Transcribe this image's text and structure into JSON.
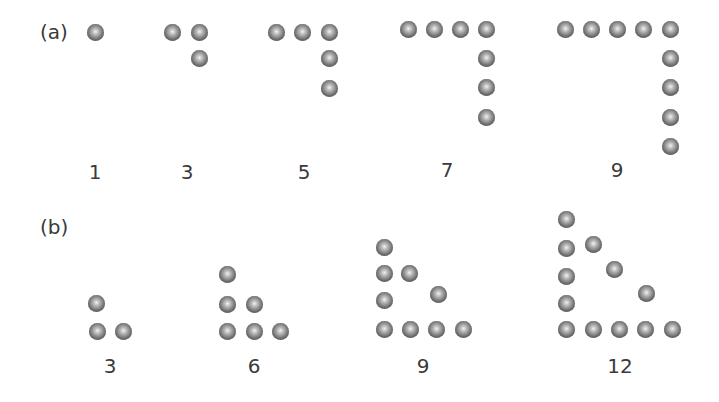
{
  "parts": [
    {
      "label": "(a)",
      "x": 40,
      "y": 32
    },
    {
      "label": "(b)",
      "x": 40,
      "y": 227
    }
  ],
  "figures": [
    {
      "part": "a",
      "count": "1",
      "label_pos": [
        95,
        172
      ],
      "dots": [
        [
          95,
          32
        ]
      ]
    },
    {
      "part": "a",
      "count": "3",
      "label_pos": [
        187,
        172
      ],
      "dots": [
        [
          172,
          32
        ],
        [
          199,
          32
        ],
        [
          199,
          58
        ]
      ]
    },
    {
      "part": "a",
      "count": "5",
      "label_pos": [
        304,
        172
      ],
      "dots": [
        [
          276,
          32
        ],
        [
          302,
          32
        ],
        [
          329,
          32
        ],
        [
          329,
          58
        ],
        [
          329,
          88
        ]
      ]
    },
    {
      "part": "a",
      "count": "7",
      "label_pos": [
        447,
        170
      ],
      "dots": [
        [
          408,
          29
        ],
        [
          434,
          29
        ],
        [
          460,
          29
        ],
        [
          486,
          29
        ],
        [
          486,
          58
        ],
        [
          486,
          87
        ],
        [
          486,
          117
        ]
      ]
    },
    {
      "part": "a",
      "count": "9",
      "label_pos": [
        617,
        170
      ],
      "dots": [
        [
          565,
          29
        ],
        [
          591,
          29
        ],
        [
          617,
          29
        ],
        [
          643,
          29
        ],
        [
          670,
          29
        ],
        [
          670,
          58
        ],
        [
          670,
          87
        ],
        [
          670,
          117
        ],
        [
          670,
          146
        ]
      ]
    },
    {
      "part": "b",
      "count": "3",
      "label_pos": [
        110,
        366
      ],
      "dots": [
        [
          96,
          303
        ],
        [
          97,
          331
        ],
        [
          123,
          331
        ]
      ]
    },
    {
      "part": "b",
      "count": "6",
      "label_pos": [
        254,
        366
      ],
      "dots": [
        [
          227,
          274
        ],
        [
          227,
          304
        ],
        [
          254,
          304
        ],
        [
          227,
          331
        ],
        [
          254,
          331
        ],
        [
          280,
          331
        ]
      ]
    },
    {
      "part": "b",
      "count": "9",
      "label_pos": [
        423,
        366
      ],
      "dots": [
        [
          384,
          247
        ],
        [
          384,
          273
        ],
        [
          409,
          273
        ],
        [
          384,
          300
        ],
        [
          438,
          294
        ],
        [
          384,
          329
        ],
        [
          410,
          329
        ],
        [
          436,
          329
        ],
        [
          463,
          329
        ]
      ]
    },
    {
      "part": "b",
      "count": "12",
      "label_pos": [
        620,
        366
      ],
      "dots": [
        [
          566,
          219
        ],
        [
          566,
          248
        ],
        [
          593,
          244
        ],
        [
          566,
          276
        ],
        [
          614,
          269
        ],
        [
          566,
          303
        ],
        [
          646,
          293
        ],
        [
          566,
          329
        ],
        [
          593,
          329
        ],
        [
          619,
          329
        ],
        [
          645,
          329
        ],
        [
          672,
          329
        ]
      ]
    }
  ]
}
